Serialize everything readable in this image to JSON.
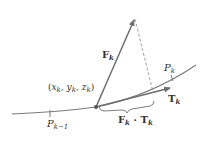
{
  "labels": {
    "force_vector": {
      "main": "F",
      "sub": "k"
    },
    "tangent_vector": {
      "main": "T",
      "sub": "k"
    },
    "point_pk": {
      "main": "P",
      "sub": "k"
    },
    "point_pk_minus_1": {
      "main": "P",
      "sub": "k−1"
    },
    "coordinates": {
      "open": "(",
      "x": "x",
      "y": "y",
      "z": "z",
      "sub": "k",
      "sep": ", ",
      "close": ")"
    },
    "dot_product": {
      "f": "F",
      "dot": " · ",
      "t": "T",
      "sub": "k"
    }
  },
  "colors": {
    "curve": "#7a7a7a",
    "vector": "#6e6e6e",
    "dashed": "#8a8a8a",
    "text": "#333333"
  }
}
